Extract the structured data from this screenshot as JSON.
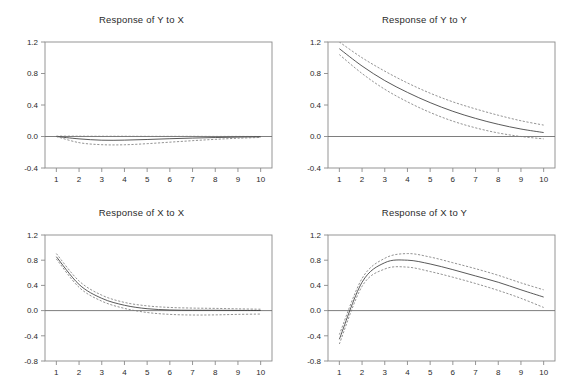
{
  "figure": {
    "kind": "impulse-response-grid",
    "rows": 2,
    "cols": 2,
    "background": "#ffffff",
    "line_color": "#3b3b3b",
    "band_color": "#777777",
    "axis_color": "#8a8a8a"
  },
  "chart_data": [
    {
      "type": "line",
      "title": "Response of Y to X",
      "xlabel": "",
      "ylabel": "",
      "grid": false,
      "legend": null,
      "xlim": [
        0.5,
        10.5
      ],
      "ylim": [
        -0.4,
        1.2
      ],
      "xticks": [
        1,
        2,
        3,
        4,
        5,
        6,
        7,
        8,
        9,
        10
      ],
      "xtick_labels": [
        "1",
        "2",
        "3",
        "4",
        "5",
        "6",
        "7",
        "8",
        "9",
        "10"
      ],
      "yticks": [
        -0.4,
        0.0,
        0.4,
        0.8,
        1.2
      ],
      "ytick_labels": [
        "-0.4",
        "0.0",
        "0.4",
        "0.8",
        "1.2"
      ],
      "x": [
        1,
        2,
        3,
        4,
        5,
        6,
        7,
        8,
        9,
        10
      ],
      "series": [
        {
          "name": "upper",
          "style": "dashed",
          "values": [
            0.005,
            0.004,
            0.003,
            0.003,
            0.002,
            0.002,
            0.002,
            0.001,
            0.001,
            0.0
          ]
        },
        {
          "name": "response",
          "style": "solid",
          "values": [
            0.0,
            -0.03,
            -0.047,
            -0.046,
            -0.038,
            -0.028,
            -0.02,
            -0.013,
            -0.008,
            -0.004
          ]
        },
        {
          "name": "lower",
          "style": "dashed",
          "values": [
            0.0,
            -0.078,
            -0.104,
            -0.105,
            -0.091,
            -0.072,
            -0.053,
            -0.036,
            -0.022,
            -0.012
          ]
        }
      ]
    },
    {
      "type": "line",
      "title": "Response of Y to Y",
      "xlabel": "",
      "ylabel": "",
      "grid": false,
      "legend": null,
      "xlim": [
        0.5,
        10.5
      ],
      "ylim": [
        -0.4,
        1.2
      ],
      "xticks": [
        1,
        2,
        3,
        4,
        5,
        6,
        7,
        8,
        9,
        10
      ],
      "xtick_labels": [
        "1",
        "2",
        "3",
        "4",
        "5",
        "6",
        "7",
        "8",
        "9",
        "10"
      ],
      "yticks": [
        -0.4,
        0.0,
        0.4,
        0.8,
        1.2
      ],
      "ytick_labels": [
        "-0.4",
        "0.0",
        "0.4",
        "0.8",
        "1.2"
      ],
      "x": [
        1,
        2,
        3,
        4,
        5,
        6,
        7,
        8,
        9,
        10
      ],
      "series": [
        {
          "name": "upper",
          "style": "dashed",
          "values": [
            1.2,
            1.0,
            0.83,
            0.68,
            0.55,
            0.44,
            0.35,
            0.27,
            0.2,
            0.145
          ]
        },
        {
          "name": "response",
          "style": "solid",
          "values": [
            1.115,
            0.895,
            0.71,
            0.56,
            0.43,
            0.32,
            0.23,
            0.155,
            0.095,
            0.05
          ]
        },
        {
          "name": "lower",
          "style": "dashed",
          "values": [
            1.04,
            0.8,
            0.6,
            0.44,
            0.305,
            0.195,
            0.11,
            0.045,
            0.0,
            -0.03
          ]
        }
      ]
    },
    {
      "type": "line",
      "title": "Response of X to X",
      "xlabel": "",
      "ylabel": "",
      "grid": false,
      "legend": null,
      "xlim": [
        0.5,
        10.5
      ],
      "ylim": [
        -0.8,
        1.2
      ],
      "xticks": [
        1,
        2,
        3,
        4,
        5,
        6,
        7,
        8,
        9,
        10
      ],
      "xtick_labels": [
        "1",
        "2",
        "3",
        "4",
        "5",
        "6",
        "7",
        "8",
        "9",
        "10"
      ],
      "yticks": [
        -0.8,
        -0.4,
        0.0,
        0.4,
        0.8,
        1.2
      ],
      "ytick_labels": [
        "-0.8",
        "-0.4",
        "0.0",
        "0.4",
        "0.8",
        "1.2"
      ],
      "x": [
        1,
        2,
        3,
        4,
        5,
        6,
        7,
        8,
        9,
        10
      ],
      "series": [
        {
          "name": "upper",
          "style": "dashed",
          "values": [
            0.905,
            0.47,
            0.245,
            0.13,
            0.075,
            0.05,
            0.04,
            0.035,
            0.028,
            0.022
          ]
        },
        {
          "name": "response",
          "style": "solid",
          "values": [
            0.855,
            0.415,
            0.195,
            0.085,
            0.03,
            0.01,
            0.005,
            0.005,
            0.003,
            0.002
          ]
        },
        {
          "name": "lower",
          "style": "dashed",
          "values": [
            0.82,
            0.37,
            0.15,
            0.035,
            -0.03,
            -0.06,
            -0.07,
            -0.068,
            -0.06,
            -0.055
          ]
        }
      ]
    },
    {
      "type": "line",
      "title": "Response of X to Y",
      "xlabel": "",
      "ylabel": "",
      "grid": false,
      "legend": null,
      "xlim": [
        0.5,
        10.5
      ],
      "ylim": [
        -0.8,
        1.2
      ],
      "xticks": [
        1,
        2,
        3,
        4,
        5,
        6,
        7,
        8,
        9,
        10
      ],
      "xtick_labels": [
        "1",
        "2",
        "3",
        "4",
        "5",
        "6",
        "7",
        "8",
        "9",
        "10"
      ],
      "yticks": [
        -0.8,
        -0.4,
        0.0,
        0.4,
        0.8,
        1.2
      ],
      "ytick_labels": [
        "-0.8",
        "-0.4",
        "0.0",
        "0.4",
        "0.8",
        "1.2"
      ],
      "x": [
        1,
        2,
        3,
        4,
        5,
        6,
        7,
        8,
        9,
        10
      ],
      "series": [
        {
          "name": "upper",
          "style": "dashed",
          "values": [
            -0.38,
            0.51,
            0.83,
            0.905,
            0.85,
            0.76,
            0.665,
            0.56,
            0.44,
            0.33
          ]
        },
        {
          "name": "response",
          "style": "solid",
          "values": [
            -0.455,
            0.45,
            0.76,
            0.8,
            0.74,
            0.65,
            0.55,
            0.45,
            0.33,
            0.215
          ]
        },
        {
          "name": "lower",
          "style": "dashed",
          "values": [
            -0.53,
            0.385,
            0.66,
            0.69,
            0.62,
            0.53,
            0.43,
            0.32,
            0.195,
            0.05
          ]
        }
      ]
    }
  ]
}
